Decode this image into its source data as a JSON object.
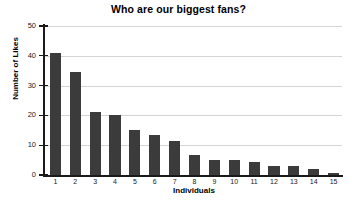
{
  "chart_data": {
    "type": "bar",
    "title": "Who are our biggest fans?",
    "xlabel": "Individuals",
    "ylabel": "Number of Likes",
    "categories": [
      "1",
      "2",
      "3",
      "4",
      "5",
      "6",
      "7",
      "8",
      "9",
      "10",
      "11",
      "12",
      "13",
      "14",
      "15"
    ],
    "values": [
      41,
      34.5,
      21,
      20,
      15,
      13.3,
      11.5,
      6.6,
      5.2,
      5.2,
      4.3,
      3.1,
      3.1,
      1.9,
      0.8
    ],
    "ylim": [
      0,
      50
    ],
    "y_ticks": [
      "0",
      "10",
      "20",
      "30",
      "40",
      "50"
    ],
    "y_tick_values": [
      0,
      10,
      20,
      30,
      40,
      50
    ],
    "grid": "horizontal",
    "legend": "none",
    "bar_color": "#3b3b3b",
    "gridline_color": "#d4d4d4",
    "axis_color": "#1a1a1a",
    "background_color": "#ffffff"
  }
}
